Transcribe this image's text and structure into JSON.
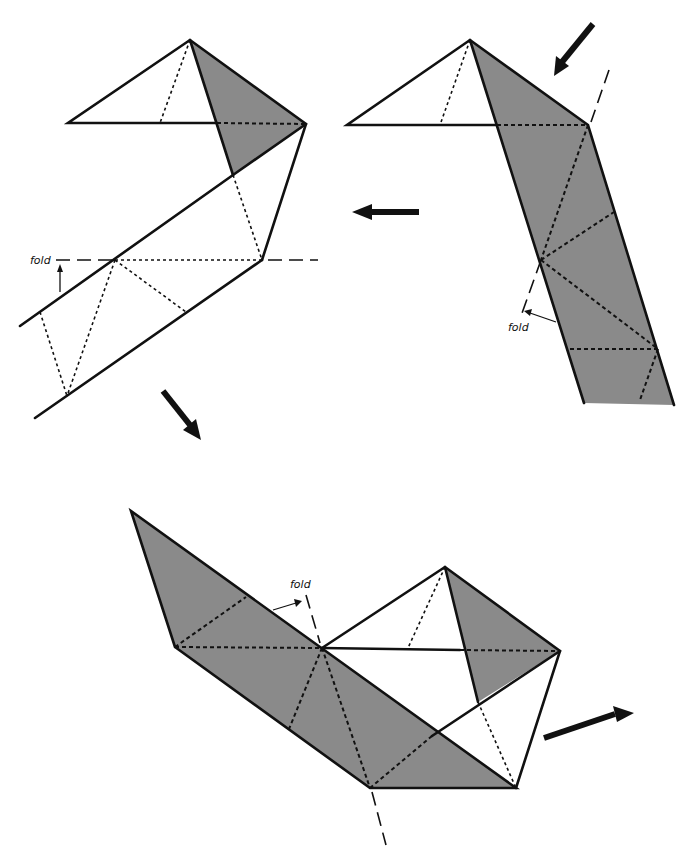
{
  "diagram": {
    "colors": {
      "shaded": "#8a8a8a",
      "line": "#111111",
      "background": "#ffffff"
    },
    "steps": [
      {
        "id": "step-1",
        "fold_label": "fold",
        "fold_type": "valley fold along horizontal dashed line, arrow up"
      },
      {
        "id": "step-2",
        "fold_label": "fold",
        "fold_type": "fold along slanted dashed line, arrow pointing left"
      },
      {
        "id": "step-3",
        "fold_label": "fold",
        "fold_type": "fold along slanted dashed line through center vertex"
      }
    ],
    "flow_arrows": [
      {
        "name": "arrow-to-step-2",
        "direction": "down-left"
      },
      {
        "name": "arrow-step-2-to-1",
        "direction": "left"
      },
      {
        "name": "arrow-to-step-3",
        "direction": "down-right"
      },
      {
        "name": "arrow-from-step-3",
        "direction": "up-right"
      }
    ]
  }
}
